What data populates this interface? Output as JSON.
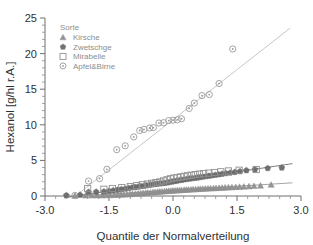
{
  "chart_data": {
    "type": "scatter",
    "title": "",
    "xlabel": "Quantile der Normalverteilung",
    "ylabel": "Hexanol [g/hl r.A.]",
    "xlim": [
      -3.0,
      3.0
    ],
    "ylim": [
      0,
      25
    ],
    "xticks": [
      "-3.0",
      "-1.5",
      "0.0",
      "1.5",
      "3.0"
    ],
    "xtickvalues": [
      -3.0,
      -1.5,
      0.0,
      1.5,
      3.0
    ],
    "yticks": [
      "0",
      "5",
      "10",
      "15",
      "20",
      "25"
    ],
    "ytickvalues": [
      0,
      5,
      10,
      15,
      20,
      25
    ],
    "grid": false,
    "legend_position": "top-left",
    "legend_title": "Sorte",
    "series": [
      {
        "name": "Kirsche",
        "marker": "triangle",
        "color": "#8f8f8f",
        "fit_line": {
          "x": [
            -2.35,
            2.8
          ],
          "y": [
            -0.05,
            1.85
          ],
          "color": "#9a9a9a"
        },
        "points": [
          [
            -2.3,
            0.05
          ],
          [
            -2.05,
            0.06
          ],
          [
            -1.9,
            0.07
          ],
          [
            -1.78,
            0.08
          ],
          [
            -1.66,
            0.09
          ],
          [
            -1.56,
            0.1
          ],
          [
            -1.47,
            0.12
          ],
          [
            -1.38,
            0.14
          ],
          [
            -1.3,
            0.16
          ],
          [
            -1.22,
            0.18
          ],
          [
            -1.15,
            0.2
          ],
          [
            -1.08,
            0.22
          ],
          [
            -1.01,
            0.25
          ],
          [
            -0.95,
            0.28
          ],
          [
            -0.88,
            0.31
          ],
          [
            -0.82,
            0.34
          ],
          [
            -0.76,
            0.37
          ],
          [
            -0.7,
            0.4
          ],
          [
            -0.64,
            0.43
          ],
          [
            -0.59,
            0.46
          ],
          [
            -0.53,
            0.49
          ],
          [
            -0.47,
            0.52
          ],
          [
            -0.42,
            0.55
          ],
          [
            -0.36,
            0.58
          ],
          [
            -0.31,
            0.61
          ],
          [
            -0.26,
            0.63
          ],
          [
            -0.2,
            0.66
          ],
          [
            -0.15,
            0.69
          ],
          [
            -0.1,
            0.71
          ],
          [
            -0.05,
            0.73
          ],
          [
            0.0,
            0.75
          ],
          [
            0.05,
            0.77
          ],
          [
            0.1,
            0.79
          ],
          [
            0.15,
            0.81
          ],
          [
            0.2,
            0.83
          ],
          [
            0.26,
            0.85
          ],
          [
            0.31,
            0.87
          ],
          [
            0.36,
            0.89
          ],
          [
            0.42,
            0.91
          ],
          [
            0.47,
            0.93
          ],
          [
            0.53,
            0.95
          ],
          [
            0.59,
            0.97
          ],
          [
            0.64,
            0.99
          ],
          [
            0.7,
            1.01
          ],
          [
            0.76,
            1.03
          ],
          [
            0.82,
            1.05
          ],
          [
            0.88,
            1.07
          ],
          [
            0.95,
            1.09
          ],
          [
            1.01,
            1.11
          ],
          [
            1.08,
            1.13
          ],
          [
            1.15,
            1.16
          ],
          [
            1.22,
            1.18
          ],
          [
            1.3,
            1.2
          ],
          [
            1.38,
            1.22
          ],
          [
            1.47,
            1.25
          ],
          [
            1.56,
            1.28
          ],
          [
            1.66,
            1.31
          ],
          [
            1.78,
            1.35
          ],
          [
            1.9,
            1.4
          ],
          [
            2.05,
            1.45
          ],
          [
            2.3,
            1.58
          ]
        ]
      },
      {
        "name": "Zwetschge",
        "marker": "pentagon",
        "color": "#6a6a6a",
        "fit_line": {
          "x": [
            -2.55,
            2.8
          ],
          "y": [
            -0.25,
            4.55
          ],
          "color": "#6f6f6f"
        },
        "points": [
          [
            -2.5,
            0.1
          ],
          [
            -2.18,
            0.15
          ],
          [
            -1.98,
            0.55
          ],
          [
            -1.8,
            0.58
          ],
          [
            -1.62,
            0.62
          ],
          [
            -1.5,
            0.7
          ],
          [
            -1.4,
            0.78
          ],
          [
            -1.3,
            0.86
          ],
          [
            -1.21,
            0.94
          ],
          [
            -1.12,
            1.02
          ],
          [
            -1.04,
            1.1
          ],
          [
            -0.96,
            1.18
          ],
          [
            -0.89,
            1.24
          ],
          [
            -0.82,
            1.3
          ],
          [
            -0.75,
            1.36
          ],
          [
            -0.68,
            1.42
          ],
          [
            -0.62,
            1.48
          ],
          [
            -0.55,
            1.54
          ],
          [
            -0.49,
            1.6
          ],
          [
            -0.43,
            1.66
          ],
          [
            -0.37,
            1.7
          ],
          [
            -0.31,
            1.74
          ],
          [
            -0.25,
            1.78
          ],
          [
            -0.19,
            1.82
          ],
          [
            -0.13,
            1.88
          ],
          [
            -0.08,
            1.95
          ],
          [
            -0.02,
            2.02
          ],
          [
            0.04,
            2.08
          ],
          [
            0.09,
            2.14
          ],
          [
            0.15,
            2.2
          ],
          [
            0.21,
            2.26
          ],
          [
            0.27,
            2.32
          ],
          [
            0.33,
            2.38
          ],
          [
            0.39,
            2.43
          ],
          [
            0.45,
            2.48
          ],
          [
            0.51,
            2.53
          ],
          [
            0.57,
            2.58
          ],
          [
            0.64,
            2.64
          ],
          [
            0.7,
            2.7
          ],
          [
            0.77,
            2.76
          ],
          [
            0.84,
            2.82
          ],
          [
            0.91,
            2.88
          ],
          [
            0.99,
            2.95
          ],
          [
            1.07,
            3.02
          ],
          [
            1.15,
            3.1
          ],
          [
            1.24,
            3.18
          ],
          [
            1.34,
            3.26
          ],
          [
            1.45,
            3.35
          ],
          [
            1.57,
            3.45
          ],
          [
            1.72,
            3.6
          ],
          [
            1.92,
            3.72
          ],
          [
            2.22,
            3.9
          ],
          [
            2.55,
            3.98
          ]
        ]
      },
      {
        "name": "Mirabelle",
        "marker": "square",
        "color": "#909090",
        "fit_line": null,
        "points": [
          [
            -2.0,
            1.05
          ],
          [
            -1.62,
            0.95
          ],
          [
            -1.42,
            1.05
          ],
          [
            -1.2,
            1.18
          ],
          [
            -1.0,
            1.32
          ],
          [
            -0.85,
            1.45
          ],
          [
            -0.72,
            1.58
          ],
          [
            -0.6,
            1.68
          ],
          [
            -0.5,
            1.78
          ],
          [
            -0.4,
            1.88
          ],
          [
            -0.31,
            1.98
          ],
          [
            -0.22,
            2.12
          ],
          [
            -0.14,
            2.28
          ],
          [
            -0.06,
            2.42
          ],
          [
            0.02,
            2.52
          ],
          [
            0.1,
            2.6
          ],
          [
            0.18,
            2.68
          ],
          [
            0.26,
            2.76
          ],
          [
            0.34,
            2.84
          ],
          [
            0.43,
            2.92
          ],
          [
            0.52,
            3.0
          ],
          [
            0.62,
            3.08
          ],
          [
            0.72,
            3.14
          ],
          [
            0.84,
            3.22
          ],
          [
            0.97,
            3.3
          ],
          [
            1.12,
            3.4
          ],
          [
            1.3,
            3.52
          ],
          [
            1.55,
            3.62
          ],
          [
            1.95,
            3.72
          ]
        ]
      },
      {
        "name": "Apfel&Birne",
        "marker": "circle-dot",
        "color": "#9a9a9a",
        "fit_line": {
          "x": [
            -2.35,
            2.75
          ],
          "y": [
            -0.3,
            23.6
          ],
          "color": "#c0c0c0"
        },
        "points": [
          [
            -2.3,
            0.08
          ],
          [
            -1.98,
            2.1
          ],
          [
            -1.72,
            2.45
          ],
          [
            -1.55,
            3.75
          ],
          [
            -1.32,
            6.5
          ],
          [
            -1.12,
            7.05
          ],
          [
            -0.92,
            8.3
          ],
          [
            -0.78,
            9.2
          ],
          [
            -0.68,
            9.35
          ],
          [
            -0.55,
            9.55
          ],
          [
            -0.46,
            9.6
          ],
          [
            -0.33,
            10.25
          ],
          [
            -0.22,
            10.3
          ],
          [
            -0.1,
            10.6
          ],
          [
            0.0,
            10.65
          ],
          [
            0.1,
            10.7
          ],
          [
            0.2,
            10.85
          ],
          [
            0.38,
            12.3
          ],
          [
            0.5,
            13.05
          ],
          [
            0.68,
            14.1
          ],
          [
            0.85,
            14.25
          ],
          [
            1.08,
            15.8
          ],
          [
            1.4,
            20.65
          ]
        ]
      }
    ]
  },
  "legend": {
    "title": "Sorte",
    "items": [
      {
        "label": "Kirsche",
        "marker": "triangle-icon"
      },
      {
        "label": "Zwetschge",
        "marker": "pentagon-icon"
      },
      {
        "label": "Mirabelle",
        "marker": "square-icon"
      },
      {
        "label": "Apfel&Birne",
        "marker": "circle-dot-icon"
      }
    ]
  },
  "axes": {
    "x_title": "Quantile der Normalverteilung",
    "y_title": "Hexanol [g/hl r.A.]"
  }
}
